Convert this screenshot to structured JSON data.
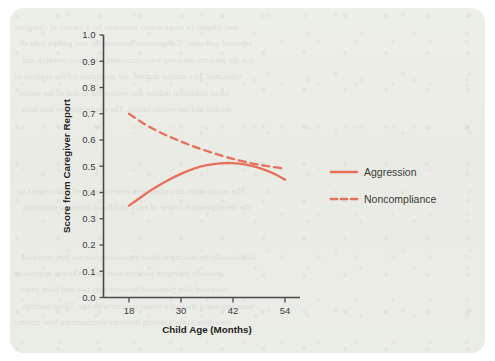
{
  "chart_data": {
    "type": "line",
    "title": "",
    "xlabel": "Child Age (Months)",
    "ylabel": "Score from Caregiver Report",
    "xlim": [
      12,
      60
    ],
    "ylim": [
      0.0,
      1.0
    ],
    "grid": false,
    "legend_position": "right",
    "x_ticks": [
      "18",
      "30",
      "42",
      "54"
    ],
    "x_tick_values": [
      18,
      30,
      42,
      54
    ],
    "y_ticks": [
      "0.0",
      "0.1",
      "0.2",
      "0.3",
      "0.4",
      "0.5",
      "0.6",
      "0.7",
      "0.8",
      "0.9",
      "1.0"
    ],
    "y_tick_values": [
      0.0,
      0.1,
      0.2,
      0.3,
      0.4,
      0.5,
      0.6,
      0.7,
      0.8,
      0.9,
      1.0
    ],
    "x": [
      18,
      21,
      24,
      27,
      30,
      33,
      36,
      39,
      42,
      45,
      48,
      51,
      54
    ],
    "series": [
      {
        "name": "Aggression",
        "style": "solid",
        "color": "#e8705a",
        "values": [
          0.35,
          0.385,
          0.418,
          0.447,
          0.471,
          0.491,
          0.504,
          0.511,
          0.512,
          0.506,
          0.494,
          0.475,
          0.449
        ]
      },
      {
        "name": "Noncompliance",
        "style": "dashed",
        "color": "#e8705a",
        "values": [
          0.7,
          0.667,
          0.639,
          0.615,
          0.594,
          0.575,
          0.558,
          0.542,
          0.528,
          0.516,
          0.506,
          0.498,
          0.491
        ]
      }
    ]
  },
  "legend": {
    "items": [
      {
        "label": "Aggression",
        "style": "solid"
      },
      {
        "label": "Noncompliance",
        "style": "dashed"
      }
    ]
  },
  "colors": {
    "accent": "#e8705a",
    "card_background": "#eaece6",
    "axis": "#4a4a48",
    "text": "#232322"
  },
  "background_text": {
    "lines": [
      "and simpler in scope across measures for a variety of caregiver",
      "reported outcomes. Comparisons between the two groups indicate",
      "that the patterns observed were consistent with prior research and",
      "replicated. In a similar manner, the procedure for the analysis of",
      "these additional indices was equivalent to that of the earlier",
      "models and the results robust. The results suggest that both",
      "",
      "",
      "",
      "",
      "The associations described here were considered with respect to",
      "the developmental course of early childhood behavior problems.",
      "",
      "",
      "Additionally, in looking at these trajectories, we see they revealed",
      "partially divergent patterns over time. Whereas aggression",
      "increased then plateaued between ages two and three years,",
      "noncompliance showed a steady decline with age. These findings",
      "contribute to the growing literature documenting how distinct"
    ]
  }
}
